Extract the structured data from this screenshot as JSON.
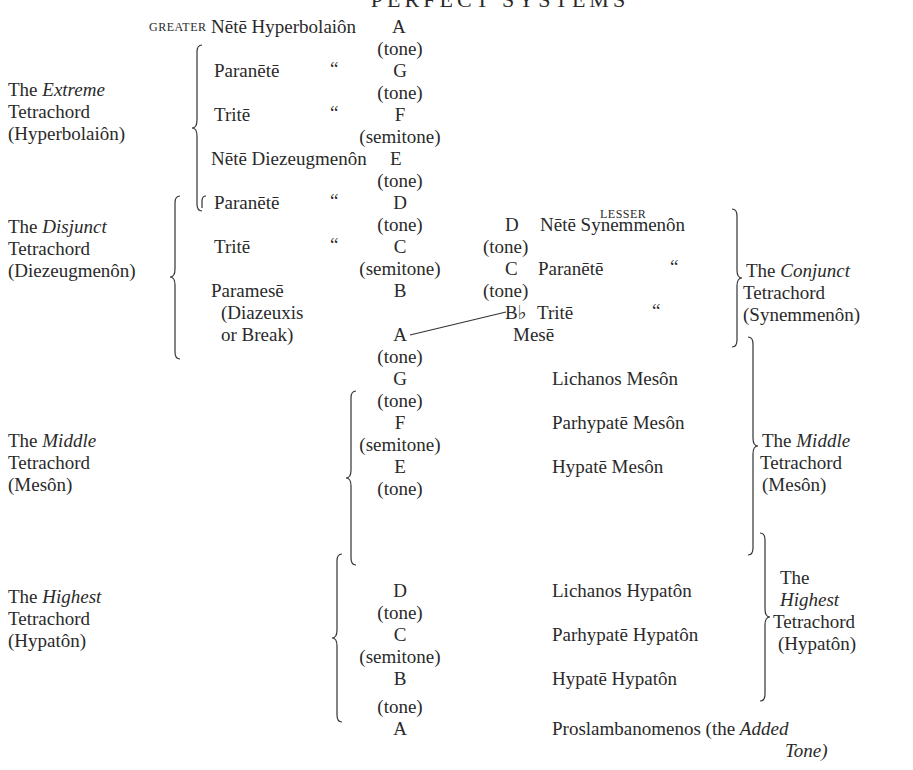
{
  "title": "PERFECT SYSTEMS",
  "greater_label": "GREATER",
  "lesser_label": "LESSER",
  "left_groups": {
    "extreme": {
      "the": "The",
      "name": "Extreme",
      "word": "Tetrachord",
      "greek": "(Hyperbolaiôn)"
    },
    "disjunct": {
      "the": "The",
      "name": "Disjunct",
      "word": "Tetrachord",
      "greek": "(Diezeugmenôn)"
    },
    "middle": {
      "the": "The",
      "name": "Middle",
      "word": "Tetrachord",
      "greek": "(Mesôn)"
    },
    "highest": {
      "the": "The",
      "name": "Highest",
      "word": "Tetrachord",
      "greek": "(Hypatôn)"
    }
  },
  "right_groups": {
    "conjunct": {
      "the": "The",
      "name": "Conjunct",
      "word": "Tetrachord",
      "greek": "(Synemmenôn)"
    },
    "middle": {
      "the": "The",
      "name": "Middle",
      "word": "Tetrachord",
      "greek": "(Mesôn)"
    },
    "highest": {
      "the": "The",
      "name": "Highest",
      "word": "Tetrachord",
      "greek": "(Hypatôn)"
    }
  },
  "greater_rows": [
    {
      "name": "Nētē Hyperbolaiôn",
      "ditto": "",
      "note": "A"
    },
    {
      "interval": "(tone)"
    },
    {
      "name": "Paranētē",
      "ditto": "“",
      "note": "G"
    },
    {
      "interval": "(tone)"
    },
    {
      "name": "Tritē",
      "ditto": "“",
      "note": "F"
    },
    {
      "interval": "(semitone)"
    },
    {
      "name": "Nētē Diezeugmenôn",
      "ditto": "",
      "note": "E"
    },
    {
      "interval": "(tone)"
    },
    {
      "name": "Paranētē",
      "ditto": "“",
      "note": "D"
    },
    {
      "interval": "(tone)"
    },
    {
      "name": "Tritē",
      "ditto": "“",
      "note": "C"
    },
    {
      "interval": "(semitone)"
    },
    {
      "name": "Paramesē",
      "ditto": "",
      "note": "B"
    },
    {
      "name": "(Diazeuxis"
    },
    {
      "name": "or Break)",
      "note": "A"
    }
  ],
  "lesser_rows": [
    {
      "note": "D",
      "name": "Nētē Synemmenôn"
    },
    {
      "interval": "(tone)"
    },
    {
      "note": "C",
      "name": "Paranētē",
      "ditto": "“"
    },
    {
      "interval": "(tone)"
    },
    {
      "note": "B♭",
      "name": "Tritē",
      "ditto": "“"
    },
    {
      "name": "Mesē"
    }
  ],
  "lower_rows": [
    {
      "interval": "(tone)"
    },
    {
      "note": "G",
      "name": "Lichanos Mesôn"
    },
    {
      "interval": "(tone)"
    },
    {
      "note": "F",
      "name": "Parhypatē Mesôn"
    },
    {
      "interval": "(semitone)"
    },
    {
      "note": "E",
      "name": "Hypatē Mesôn"
    },
    {
      "interval": "(tone)"
    },
    {
      "note": "D",
      "name": "Lichanos Hypatôn"
    },
    {
      "interval": "(tone)"
    },
    {
      "note": "C",
      "name": "Parhypatē Hypatôn"
    },
    {
      "interval": "(semitone)"
    },
    {
      "note": "B",
      "name": "Hypatē Hypatôn"
    },
    {
      "interval": "(tone)"
    },
    {
      "note": "A",
      "name": "Proslambanomenos (the",
      "italic": "Added",
      "italic2": "Tone)"
    }
  ]
}
